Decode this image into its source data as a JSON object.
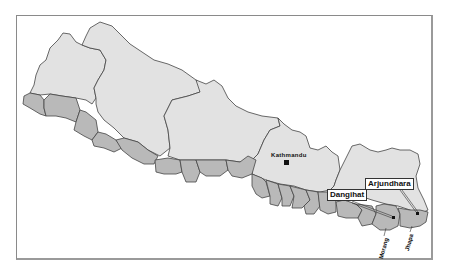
{
  "map": {
    "subject": "Nepal",
    "colors": {
      "highland": "#e2e2e2",
      "terai": "#b9b9b9",
      "border": "#444444",
      "frame": "#8a8a8a"
    },
    "labels": {
      "capital": "Kathmandu",
      "callouts": [
        {
          "label": "Dangihat"
        },
        {
          "label": "Arjundhara"
        }
      ],
      "districts": [
        {
          "label": "Morang"
        },
        {
          "label": "Jhapa"
        }
      ]
    }
  }
}
